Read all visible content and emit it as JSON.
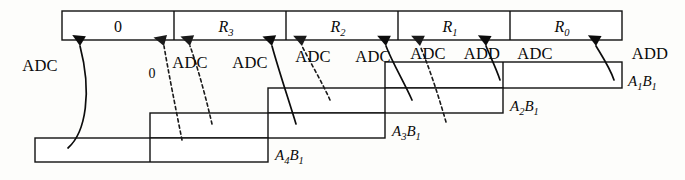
{
  "diagram": {
    "colors": {
      "stroke": "#111111",
      "background": "#fdfdfb",
      "text": "#0a0a0a"
    },
    "result_register": {
      "name": "result-register",
      "cells": [
        {
          "label": "0",
          "italic": false
        },
        {
          "label": "R",
          "sub": "3",
          "italic": true
        },
        {
          "label": "R",
          "sub": "2",
          "italic": true
        },
        {
          "label": "R",
          "sub": "1",
          "italic": true
        },
        {
          "label": "R",
          "sub": "0",
          "italic": true
        }
      ]
    },
    "partial_product_rows": [
      {
        "label": "A",
        "sub1": "1",
        "label2": "B",
        "sub2": "1"
      },
      {
        "label": "A",
        "sub1": "2",
        "label2": "B",
        "sub2": "1"
      },
      {
        "label": "A",
        "sub1": "3",
        "label2": "B",
        "sub2": "1"
      },
      {
        "label": "A",
        "sub1": "4",
        "label2": "B",
        "sub2": "1"
      }
    ],
    "operations": [
      {
        "label": "ADC",
        "style": "solid"
      },
      {
        "label": "ADC",
        "style": "dashed"
      },
      {
        "label": "ADC",
        "style": "dashed"
      },
      {
        "label": "ADC",
        "style": "solid"
      },
      {
        "label": "ADC",
        "style": "dashed"
      },
      {
        "label": "ADC",
        "style": "solid"
      },
      {
        "label": "ADD",
        "style": "dashed"
      },
      {
        "label": "ADC",
        "style": "solid"
      },
      {
        "label": "ADD",
        "style": "solid"
      }
    ],
    "carry_in_label": "0"
  }
}
